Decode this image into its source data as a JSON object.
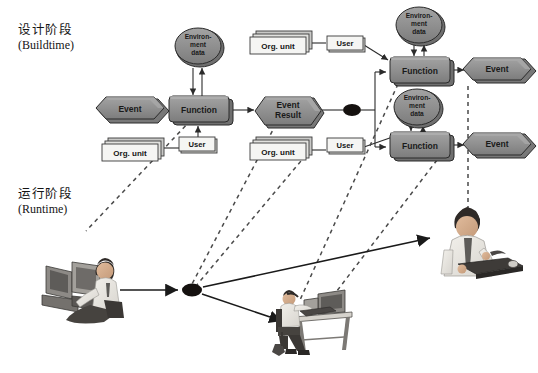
{
  "figure": {
    "type": "diagram",
    "background": "#ffffff"
  },
  "phases": [
    {
      "id": "buildtime",
      "cn": "设计阶段",
      "en": "(Buildtime)",
      "x": 18,
      "y": 27
    },
    {
      "id": "runtime",
      "cn": "运行阶段",
      "en": "(Runtime)",
      "x": 18,
      "y": 190
    }
  ],
  "palette": {
    "node_fill": "#8e8e8e",
    "node_fill_light": "#9d9d9d",
    "node_top": "#a8a8a8",
    "node_side": "#6e6e6e",
    "node_stroke": "#2b2b2b",
    "doc_fill": "#f2f2f0",
    "doc_shadow": "#b9b9b7",
    "doc_stroke": "#3a3a3a",
    "connector_dot": "#14100e",
    "line": "#2b2b2b",
    "dashed": "#4a4a4a",
    "text_dark": "#141414",
    "text_on_node": "#1e1e1e",
    "skin": "#d9b091",
    "shirt": "#e9e7e2",
    "tie": "#5d5b58",
    "hair": "#2f2a27",
    "equip": "#6b6865"
  },
  "nodes": [
    {
      "id": "evt-l",
      "kind": "event",
      "label": "Event",
      "cx": 129,
      "cy": 110,
      "w": 66,
      "h": 24
    },
    {
      "id": "fn-l",
      "kind": "function",
      "label": "Function",
      "cx": 199,
      "cy": 110,
      "w": 60,
      "h": 26
    },
    {
      "id": "env-l",
      "kind": "env",
      "label": "Environ- ment data",
      "lines": [
        "Environ-",
        "ment",
        "data"
      ],
      "cx": 202,
      "cy": 47,
      "w": 46,
      "h": 36
    },
    {
      "id": "org-l",
      "kind": "orgunit",
      "label": "Org. unit",
      "cx": 131,
      "cy": 152,
      "w": 58,
      "h": 20
    },
    {
      "id": "usr-l",
      "kind": "user",
      "label": "User",
      "cx": 198,
      "cy": 145,
      "w": 38,
      "h": 15
    },
    {
      "id": "evtres",
      "kind": "event",
      "label": "Event Result",
      "lines": [
        "Event",
        "Result"
      ],
      "cx": 289,
      "cy": 112,
      "w": 62,
      "h": 28
    },
    {
      "id": "dot-build",
      "kind": "dot",
      "label": "",
      "cx": 352,
      "cy": 110,
      "w": 17,
      "h": 11
    },
    {
      "id": "org-t",
      "kind": "orgunit",
      "label": "Org. unit",
      "cx": 280,
      "cy": 44,
      "w": 58,
      "h": 20
    },
    {
      "id": "usr-t",
      "kind": "user",
      "label": "User",
      "cx": 345,
      "cy": 43,
      "w": 38,
      "h": 15
    },
    {
      "id": "env-t",
      "kind": "env",
      "label": "Environ- ment data",
      "lines": [
        "Environ-",
        "ment",
        "data"
      ],
      "cx": 420,
      "cy": 25,
      "w": 46,
      "h": 36
    },
    {
      "id": "fn-t",
      "kind": "function",
      "label": "Function",
      "cx": 420,
      "cy": 70,
      "w": 60,
      "h": 26
    },
    {
      "id": "evt-t",
      "kind": "event",
      "label": "Event",
      "cx": 496,
      "cy": 70,
      "w": 66,
      "h": 24
    },
    {
      "id": "org-b",
      "kind": "orgunit",
      "label": "Org. unit",
      "cx": 280,
      "cy": 150,
      "w": 58,
      "h": 20
    },
    {
      "id": "usr-b",
      "kind": "user",
      "label": "User",
      "cx": 345,
      "cy": 145,
      "w": 38,
      "h": 15
    },
    {
      "id": "env-b",
      "kind": "env",
      "label": "Environ- ment data",
      "lines": [
        "Environ-",
        "ment",
        "data"
      ],
      "cx": 417,
      "cy": 107,
      "w": 46,
      "h": 36
    },
    {
      "id": "fn-b",
      "kind": "function",
      "label": "Function",
      "cx": 420,
      "cy": 145,
      "w": 60,
      "h": 26
    },
    {
      "id": "evt-b",
      "kind": "event",
      "label": "Event",
      "cx": 496,
      "cy": 145,
      "w": 66,
      "h": 24
    }
  ],
  "runtime_actors": [
    {
      "id": "actor-left",
      "name": "person-at-terminal",
      "cx": 95,
      "cy": 290
    },
    {
      "id": "dot-runtime",
      "name": "runtime-connector-dot",
      "cx": 192,
      "cy": 290
    },
    {
      "id": "actor-right",
      "name": "person-standing-desk",
      "cx": 463,
      "cy": 255
    },
    {
      "id": "actor-center",
      "name": "person-at-desk",
      "cx": 320,
      "cy": 320
    }
  ],
  "edges": [
    {
      "from": "evt-l",
      "to": "fn-l",
      "style": "solid"
    },
    {
      "from": "fn-l",
      "to": "env-l",
      "style": "solid"
    },
    {
      "from": "env-l",
      "to": "fn-l",
      "style": "solid"
    },
    {
      "from": "usr-l",
      "to": "fn-l",
      "style": "solid"
    },
    {
      "from": "org-l",
      "to": "usr-l",
      "style": "solid"
    },
    {
      "from": "fn-l",
      "to": "evtres",
      "style": "solid"
    },
    {
      "from": "evtres",
      "to": "dot-build",
      "style": "solid"
    },
    {
      "from": "dot-build",
      "to": "fn-t",
      "style": "solid"
    },
    {
      "from": "dot-build",
      "to": "fn-b",
      "style": "solid"
    },
    {
      "from": "org-t",
      "to": "usr-t",
      "style": "solid"
    },
    {
      "from": "usr-t",
      "to": "fn-t",
      "style": "solid"
    },
    {
      "from": "fn-t",
      "to": "env-t",
      "style": "solid"
    },
    {
      "from": "env-t",
      "to": "fn-t",
      "style": "solid"
    },
    {
      "from": "fn-t",
      "to": "evt-t",
      "style": "solid"
    },
    {
      "from": "org-b",
      "to": "usr-b",
      "style": "solid"
    },
    {
      "from": "usr-b",
      "to": "fn-b",
      "style": "solid"
    },
    {
      "from": "fn-b",
      "to": "env-b",
      "style": "solid"
    },
    {
      "from": "env-b",
      "to": "fn-b",
      "style": "solid"
    },
    {
      "from": "fn-b",
      "to": "evt-b",
      "style": "solid"
    },
    {
      "from": "actor-left",
      "to": "dot-runtime",
      "style": "solid"
    },
    {
      "from": "dot-runtime",
      "to": "actor-right",
      "style": "solid"
    },
    {
      "from": "dot-runtime",
      "to": "actor-center",
      "style": "solid"
    },
    {
      "from": "fn-l",
      "to": "dot-runtime",
      "style": "dashed"
    },
    {
      "from": "fn-t",
      "to": "dot-runtime",
      "style": "dashed"
    },
    {
      "from": "evtres",
      "to": "org-b",
      "style": "dashed"
    },
    {
      "from": "fn-b",
      "to": "actor-center",
      "style": "dashed"
    },
    {
      "from": "org-t",
      "to": "actor-right",
      "style": "dashed"
    }
  ]
}
